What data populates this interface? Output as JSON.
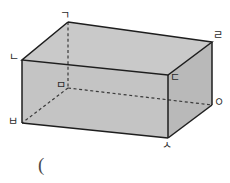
{
  "figure": {
    "name": "rectangular-prism-diagram",
    "shape_type": "cuboid",
    "background_color": "#ffffff",
    "faces": {
      "top_face_color": "#c9c9c9",
      "front_face_color": "#c4c4c4",
      "right_face_color": "#b9b9b9",
      "edge_color": "#1e1e1e",
      "hidden_edge_color": "#3a3a3a"
    },
    "vertices": [
      {
        "id": "top-back-left",
        "label": "ㄱ",
        "x": 68,
        "y": 22,
        "label_x": 60,
        "label_y": 10,
        "hidden": false
      },
      {
        "id": "top-front-left",
        "label": "ㄴ",
        "x": 22,
        "y": 60,
        "label_x": 9,
        "label_y": 52,
        "hidden": false
      },
      {
        "id": "top-front-right",
        "label": "ㄷ",
        "x": 168,
        "y": 75,
        "label_x": 170,
        "label_y": 72,
        "hidden": false
      },
      {
        "id": "top-back-right",
        "label": "ㄹ",
        "x": 212,
        "y": 42,
        "label_x": 213,
        "label_y": 30,
        "hidden": false
      },
      {
        "id": "bottom-back-left",
        "label": "ㅁ",
        "x": 68,
        "y": 88,
        "label_x": 56,
        "label_y": 80,
        "hidden": true
      },
      {
        "id": "bottom-back-right",
        "label": "ㅇ",
        "x": 212,
        "y": 105,
        "label_x": 214,
        "label_y": 97,
        "hidden": true
      },
      {
        "id": "bottom-front-left",
        "label": "ㅂ",
        "x": 22,
        "y": 123,
        "label_x": 8,
        "label_y": 116,
        "hidden": false
      },
      {
        "id": "bottom-front-right",
        "label": "ㅅ",
        "x": 168,
        "y": 138,
        "label_x": 162,
        "label_y": 140,
        "hidden": false
      }
    ],
    "caption": "("
  }
}
